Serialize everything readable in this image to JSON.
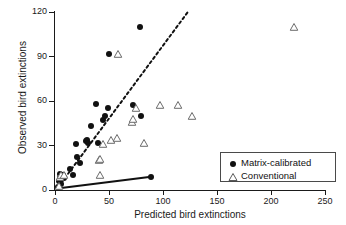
{
  "chart_data": {
    "type": "scatter",
    "title": "",
    "xlabel": "Predicted bird extinctions",
    "ylabel": "Observed bird extinctions",
    "xlim": [
      0,
      250
    ],
    "ylim": [
      0,
      120
    ],
    "xticks": [
      0,
      50,
      100,
      150,
      200,
      250
    ],
    "yticks": [
      0,
      30,
      60,
      90,
      120
    ],
    "grid": false,
    "legend_position": "bottom-right",
    "series": [
      {
        "name": "Matrix-calibrated",
        "marker": "filled-circle",
        "color": "#111111",
        "points": [
          [
            3,
            2
          ],
          [
            4,
            6
          ],
          [
            5,
            8
          ],
          [
            5,
            11
          ],
          [
            6,
            9
          ],
          [
            6,
            4
          ],
          [
            7,
            10
          ],
          [
            8,
            8
          ],
          [
            14,
            14
          ],
          [
            17,
            10
          ],
          [
            19,
            31
          ],
          [
            20,
            22
          ],
          [
            23,
            18
          ],
          [
            29,
            33
          ],
          [
            30,
            34
          ],
          [
            31,
            32
          ],
          [
            33,
            43
          ],
          [
            38,
            58
          ],
          [
            40,
            32
          ],
          [
            44,
            47
          ],
          [
            46,
            50
          ],
          [
            49,
            55
          ],
          [
            50,
            92
          ],
          [
            72,
            57
          ],
          [
            79,
            110
          ],
          [
            80,
            50
          ],
          [
            89,
            9
          ]
        ]
      },
      {
        "name": "Conventional",
        "marker": "open-triangle",
        "color": "#6b6b6b",
        "points": [
          [
            4,
            3
          ],
          [
            5,
            9
          ],
          [
            6,
            10
          ],
          [
            8,
            10
          ],
          [
            41,
            20
          ],
          [
            42,
            21
          ],
          [
            42,
            10
          ],
          [
            44,
            31
          ],
          [
            52,
            34
          ],
          [
            57,
            35
          ],
          [
            58,
            92
          ],
          [
            71,
            46
          ],
          [
            72,
            48
          ],
          [
            75,
            55
          ],
          [
            82,
            32
          ],
          [
            97,
            57
          ],
          [
            114,
            57
          ],
          [
            127,
            50
          ],
          [
            221,
            110
          ]
        ]
      }
    ],
    "trendlines": [
      {
        "name": "matrix-calibrated-fit",
        "style": "dashed",
        "color": "#111111",
        "x0": 3,
        "y0": 2,
        "x1": 123,
        "y1": 120
      },
      {
        "name": "conventional-fit",
        "style": "solid",
        "color": "#111111",
        "x0": 2,
        "y0": 1,
        "x1": 89,
        "y1": 9
      }
    ]
  },
  "legend": {
    "entries": [
      {
        "label": "Matrix-calibrated",
        "marker": "filled-circle"
      },
      {
        "label": "Conventional",
        "marker": "open-triangle"
      }
    ]
  },
  "axis": {
    "x_title": "Predicted bird extinctions",
    "y_title": "Observed bird extinctions",
    "x_tick_labels": [
      "0",
      "50",
      "100",
      "150",
      "200",
      "250"
    ],
    "y_tick_labels": [
      "0",
      "30",
      "60",
      "90",
      "120"
    ]
  }
}
